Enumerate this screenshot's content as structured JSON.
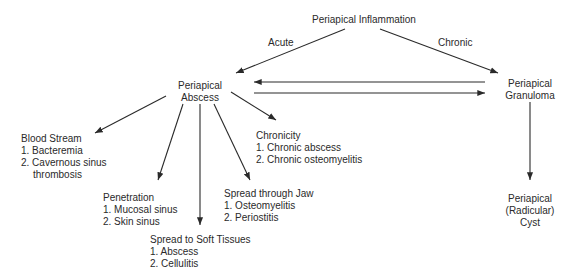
{
  "nodes": {
    "root": {
      "label": "Periapical Inflammation"
    },
    "abscess": {
      "line1": "Periapical",
      "line2": "Abscess"
    },
    "granuloma": {
      "line1": "Periapical",
      "line2": "Granuloma"
    },
    "cyst": {
      "line1": "Periapical",
      "line2": "(Radicular)",
      "line3": "Cyst"
    },
    "blood_stream": {
      "title": "Blood Stream",
      "items": [
        "1. Bacteremia",
        "2. Cavernous sinus",
        "thrombosis"
      ]
    },
    "penetration": {
      "title": "Penetration",
      "items": [
        "1. Mucosal sinus",
        "2. Skin sinus"
      ]
    },
    "soft_tissues": {
      "title": "Spread to Soft Tissues",
      "items": [
        "1. Abscess",
        "2. Cellulitis"
      ]
    },
    "jaw": {
      "title": "Spread through Jaw",
      "items": [
        "1. Osteomyelitis",
        "2. Periostitis"
      ]
    },
    "chronicity": {
      "title": "Chronicity",
      "items": [
        "1. Chronic abscess",
        "2. Chronic osteomyelitis"
      ]
    }
  },
  "edge_labels": {
    "acute": "Acute",
    "chronic": "Chronic"
  },
  "colors": {
    "line": "#2a2a2a",
    "background": "#ffffff"
  }
}
